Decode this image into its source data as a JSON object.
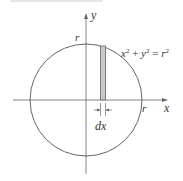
{
  "figure": {
    "equation_label": {
      "x_base": "x",
      "x_exp": "2",
      "plus": " + ",
      "y_base": "y",
      "y_exp": "2",
      "eq": " = ",
      "r_base": "r",
      "r_exp": "2"
    },
    "axis_labels": {
      "x": "x",
      "y": "y"
    },
    "radius_labels": {
      "top": "r",
      "right": "r"
    },
    "strip_label": "dx",
    "colors": {
      "line": "#555555",
      "strip_fill": "#c8c8c8",
      "strip_border": "#666666",
      "top_rule": "#e4e4e4"
    }
  }
}
